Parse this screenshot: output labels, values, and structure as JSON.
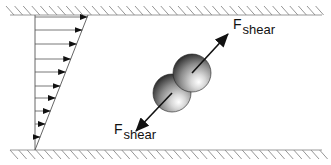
{
  "diagram": {
    "title": "",
    "walls": {
      "top": {
        "y": 15,
        "x1": 10,
        "x2": 322
      },
      "bottom": {
        "y": 150,
        "x1": 10,
        "x2": 322
      },
      "hatch_color": "#8a8a8a",
      "line_color": "#9a9a9a"
    },
    "velocity_profile": {
      "axis_x": 35,
      "y_top": 15,
      "y_bottom": 150,
      "top_tip_x": 88,
      "arrow_ys": [
        17,
        30,
        44,
        59,
        72,
        86,
        98,
        111,
        124,
        137
      ],
      "line_color": "#555555"
    },
    "particles": [
      {
        "name": "upper-sphere",
        "cx": 192,
        "cy": 73,
        "r": 19
      },
      {
        "name": "lower-sphere",
        "cx": 172,
        "cy": 93,
        "r": 19
      }
    ],
    "forces": [
      {
        "name": "upper-shear-force",
        "x1": 192,
        "y1": 73,
        "x2": 228,
        "y2": 34
      },
      {
        "name": "lower-shear-force",
        "x1": 172,
        "y1": 93,
        "x2": 136,
        "y2": 131
      }
    ],
    "labels": {
      "upper": {
        "main": "F",
        "sub": "shear"
      },
      "lower": {
        "main": "F",
        "sub": "shear"
      }
    }
  }
}
